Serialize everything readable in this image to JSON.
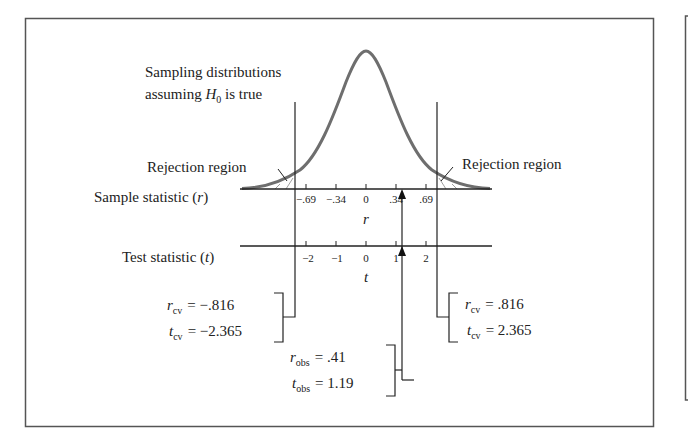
{
  "title_label": {
    "line1": "Sampling distributions",
    "line2_prefix": "assuming ",
    "line2_var": "H",
    "line2_sub": "0",
    "line2_suffix": " is true"
  },
  "rejection_left": "Rejection region",
  "rejection_right": "Rejection region",
  "r_axis": {
    "label_prefix": "Sample statistic (",
    "label_var": "r",
    "label_suffix": ")",
    "var": "r",
    "ticks": [
      "−.69",
      "−.34",
      "0",
      ".34",
      ".69"
    ]
  },
  "t_axis": {
    "label_prefix": "Test statistic (",
    "label_var": "t",
    "label_suffix": ")",
    "var": "t",
    "ticks": [
      "−2",
      "−1",
      "0",
      "1",
      "2"
    ]
  },
  "critical_left": {
    "r_var": "r",
    "r_sub": "cv",
    "r_value": "= −.816",
    "t_var": "t",
    "t_sub": "cv",
    "t_value": "= −2.365"
  },
  "critical_right": {
    "r_var": "r",
    "r_sub": "cv",
    "r_value": "= .816",
    "t_var": "t",
    "t_sub": "cv",
    "t_value": "= 2.365"
  },
  "observed": {
    "r_var": "r",
    "r_sub": "obs",
    "r_value": "= .41",
    "t_var": "t",
    "t_sub": "obs",
    "t_value": "= 1.19"
  },
  "colors": {
    "curve": "#6e6e6e",
    "line": "#2a2a2a",
    "border": "#555555"
  }
}
